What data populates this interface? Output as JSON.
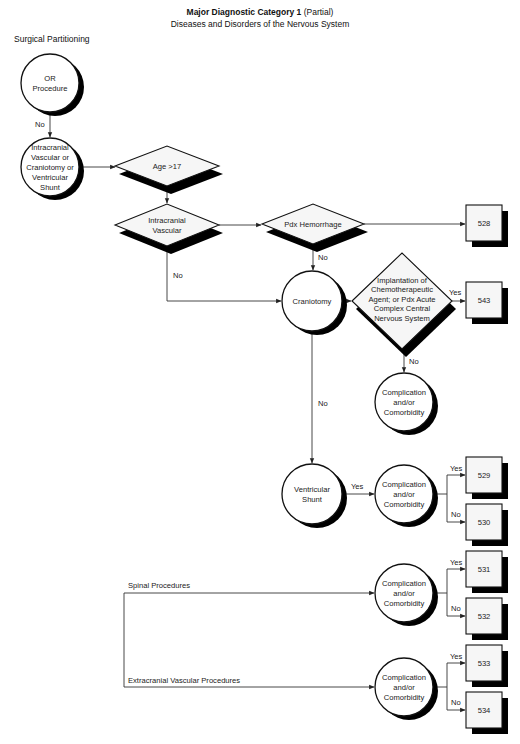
{
  "header": {
    "title_bold": "Major Diagnostic Category 1",
    "title_suffix": " (Partial)",
    "subtitle": "Diseases and Disorders of the Nervous System"
  },
  "section_label": "Surgical Partitioning",
  "nodes": {
    "or_procedure": {
      "type": "circle",
      "lines": [
        "OR",
        "Procedure"
      ]
    },
    "intracranial_group": {
      "type": "circle",
      "lines": [
        "Intracranial",
        "Vascular or",
        "Craniotomy or",
        "Ventricular",
        "Shunt"
      ]
    },
    "age": {
      "type": "diamond",
      "lines": [
        "Age >17"
      ]
    },
    "intracranial_vascular": {
      "type": "diamond",
      "lines": [
        "Intracranial",
        "Vascular"
      ]
    },
    "pdx_hemorrhage": {
      "type": "diamond",
      "lines": [
        "Pdx Hemorrhage"
      ]
    },
    "craniotomy": {
      "type": "circle",
      "lines": [
        "Craniotomy"
      ]
    },
    "implantation": {
      "type": "diamond",
      "lines": [
        "Implantation of",
        "Chemotherapeutic",
        "Agent; or Pdx Acute",
        "Complex Central",
        "Nervous System"
      ]
    },
    "cc_craniotomy": {
      "type": "circle",
      "lines": [
        "Complication",
        "and/or",
        "Comorbidity"
      ]
    },
    "ventricular_shunt": {
      "type": "circle",
      "lines": [
        "Ventricular",
        "Shunt"
      ]
    },
    "cc_shunt": {
      "type": "circle",
      "lines": [
        "Complication",
        "and/or",
        "Comorbidity"
      ]
    },
    "cc_spinal": {
      "type": "circle",
      "lines": [
        "Complication",
        "and/or",
        "Comorbidity"
      ]
    },
    "cc_extracranial": {
      "type": "circle",
      "lines": [
        "Complication",
        "and/or",
        "Comorbidity"
      ]
    },
    "drg_528": {
      "type": "box",
      "lines": [
        "528"
      ]
    },
    "drg_543": {
      "type": "box",
      "lines": [
        "543"
      ]
    },
    "drg_529": {
      "type": "box",
      "lines": [
        "529"
      ]
    },
    "drg_530": {
      "type": "box",
      "lines": [
        "530"
      ]
    },
    "drg_531": {
      "type": "box",
      "lines": [
        "531"
      ]
    },
    "drg_532": {
      "type": "box",
      "lines": [
        "532"
      ]
    },
    "drg_533": {
      "type": "box",
      "lines": [
        "533"
      ]
    },
    "drg_534": {
      "type": "box",
      "lines": [
        "534"
      ]
    }
  },
  "edges": [
    {
      "from": "or_procedure",
      "to": "intracranial_group",
      "label": "No"
    },
    {
      "from": "intracranial_group",
      "to": "age",
      "label": ""
    },
    {
      "from": "age",
      "to": "intracranial_vascular",
      "label": ""
    },
    {
      "from": "intracranial_vascular",
      "to": "pdx_hemorrhage",
      "label": ""
    },
    {
      "from": "intracranial_vascular",
      "to": "craniotomy",
      "label": "No"
    },
    {
      "from": "pdx_hemorrhage",
      "to": "drg_528",
      "label": ""
    },
    {
      "from": "pdx_hemorrhage",
      "to": "craniotomy",
      "label": "No"
    },
    {
      "from": "craniotomy",
      "to": "implantation",
      "label": ""
    },
    {
      "from": "implantation",
      "to": "drg_543",
      "label": "Yes"
    },
    {
      "from": "implantation",
      "to": "cc_craniotomy",
      "label": "No"
    },
    {
      "from": "craniotomy",
      "to": "ventricular_shunt",
      "label": "No"
    },
    {
      "from": "ventricular_shunt",
      "to": "cc_shunt",
      "label": "Yes"
    },
    {
      "from": "cc_shunt",
      "to": "drg_529",
      "label": "Yes"
    },
    {
      "from": "cc_shunt",
      "to": "drg_530",
      "label": "No"
    },
    {
      "from": "spinal_procedures",
      "to": "cc_spinal",
      "label": "Spinal Procedures"
    },
    {
      "from": "cc_spinal",
      "to": "drg_531",
      "label": "Yes"
    },
    {
      "from": "cc_spinal",
      "to": "drg_532",
      "label": "No"
    },
    {
      "from": "extracranial_procedures",
      "to": "cc_extracranial",
      "label": "Extracranial Vascular Procedures"
    },
    {
      "from": "cc_extracranial",
      "to": "drg_533",
      "label": "Yes"
    },
    {
      "from": "cc_extracranial",
      "to": "drg_534",
      "label": "No"
    }
  ],
  "labels": {
    "no": "No",
    "yes": "Yes",
    "spinal": "Spinal Procedures",
    "extracranial": "Extracranial Vascular Procedures"
  }
}
